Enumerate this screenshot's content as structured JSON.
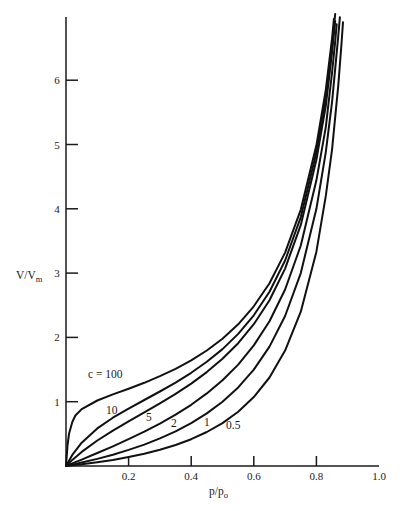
{
  "chart_data": {
    "type": "line",
    "title": "",
    "xlabel": "p/p",
    "xlabel_sub": "o",
    "ylabel": "V/V",
    "ylabel_sub": "m",
    "xlim": [
      0,
      1.0
    ],
    "ylim": [
      0,
      6.98
    ],
    "grid": false,
    "legend": "inline curve labels",
    "x_ticks": [
      {
        "value": 0.2,
        "label": "0.2"
      },
      {
        "value": 0.4,
        "label": "0.4"
      },
      {
        "value": 0.6,
        "label": "0.6"
      },
      {
        "value": 0.8,
        "label": "0.8"
      },
      {
        "value": 1.0,
        "label": "1.0"
      }
    ],
    "y_ticks": [
      {
        "value": 1,
        "label": "1"
      },
      {
        "value": 2,
        "label": "2"
      },
      {
        "value": 3,
        "label": "3"
      },
      {
        "value": 4,
        "label": "4"
      },
      {
        "value": 5,
        "label": "5"
      },
      {
        "value": 6,
        "label": "6"
      }
    ],
    "series": [
      {
        "name": "c = 100",
        "label": "c = 100",
        "label_pos": [
          88,
          378
        ],
        "x": [
          0,
          0.005,
          0.01,
          0.02,
          0.03,
          0.05,
          0.1,
          0.15,
          0.2,
          0.25,
          0.3,
          0.35,
          0.4,
          0.45,
          0.5,
          0.55,
          0.6,
          0.65,
          0.7,
          0.75,
          0.8,
          0.83,
          0.85,
          0.856
        ],
        "y": [
          0,
          0.335,
          0.505,
          0.685,
          0.785,
          0.885,
          1.019,
          1.113,
          1.202,
          1.294,
          1.396,
          1.51,
          1.642,
          1.796,
          1.98,
          2.204,
          2.483,
          2.842,
          3.319,
          3.987,
          4.988,
          5.85,
          6.655,
          6.95
        ]
      },
      {
        "name": "10",
        "label": "10",
        "label_pos": [
          106,
          414
        ],
        "x": [
          0,
          0.02,
          0.05,
          0.1,
          0.15,
          0.2,
          0.25,
          0.3,
          0.35,
          0.4,
          0.45,
          0.5,
          0.55,
          0.6,
          0.65,
          0.7,
          0.75,
          0.8,
          0.83,
          0.85,
          0.86
        ],
        "y": [
          0,
          0.173,
          0.363,
          0.585,
          0.751,
          0.893,
          1.026,
          1.158,
          1.297,
          1.449,
          1.62,
          1.818,
          2.054,
          2.344,
          2.711,
          3.196,
          3.871,
          4.878,
          5.72,
          6.551,
          7.03
        ]
      },
      {
        "name": "5",
        "label": "5",
        "label_pos": [
          146,
          421
        ],
        "x": [
          0,
          0.02,
          0.05,
          0.1,
          0.15,
          0.2,
          0.25,
          0.3,
          0.35,
          0.4,
          0.45,
          0.5,
          0.55,
          0.6,
          0.65,
          0.7,
          0.75,
          0.8,
          0.83,
          0.85,
          0.86
        ],
        "y": [
          0,
          0.0945,
          0.219,
          0.397,
          0.551,
          0.694,
          0.833,
          0.974,
          1.122,
          1.282,
          1.461,
          1.667,
          1.91,
          2.206,
          2.579,
          3.07,
          3.75,
          4.762,
          5.6,
          6.439,
          6.918
        ]
      },
      {
        "name": "2",
        "label": "2",
        "label_pos": [
          171,
          427
        ],
        "x": [
          0,
          0.02,
          0.05,
          0.1,
          0.15,
          0.2,
          0.25,
          0.3,
          0.35,
          0.4,
          0.45,
          0.5,
          0.55,
          0.6,
          0.65,
          0.7,
          0.75,
          0.8,
          0.83,
          0.85,
          0.86,
          0.865
        ],
        "y": [
          0,
          0.04,
          0.1,
          0.202,
          0.307,
          0.417,
          0.533,
          0.659,
          0.798,
          0.952,
          1.129,
          1.333,
          1.577,
          1.875,
          2.251,
          2.745,
          3.429,
          4.444,
          5.27,
          6.126,
          6.605,
          6.871
        ]
      },
      {
        "name": "1",
        "label": "1",
        "label_pos": [
          204,
          426
        ],
        "x": [
          0,
          0.02,
          0.05,
          0.1,
          0.15,
          0.2,
          0.25,
          0.3,
          0.35,
          0.4,
          0.45,
          0.5,
          0.55,
          0.6,
          0.65,
          0.7,
          0.75,
          0.8,
          0.83,
          0.85,
          0.87,
          0.875
        ],
        "y": [
          0,
          0.02,
          0.053,
          0.111,
          0.176,
          0.25,
          0.333,
          0.429,
          0.538,
          0.667,
          0.818,
          1.0,
          1.222,
          1.5,
          1.857,
          2.333,
          3.0,
          4.0,
          4.882,
          5.667,
          6.692,
          6.98
        ]
      },
      {
        "name": "0.5",
        "label": "0.5",
        "label_pos": [
          226,
          429
        ],
        "x": [
          0,
          0.02,
          0.05,
          0.1,
          0.15,
          0.2,
          0.25,
          0.3,
          0.35,
          0.4,
          0.45,
          0.5,
          0.55,
          0.6,
          0.65,
          0.7,
          0.75,
          0.8,
          0.83,
          0.85,
          0.87,
          0.88,
          0.885
        ],
        "y": [
          0,
          0.0103,
          0.027,
          0.0585,
          0.0954,
          0.139,
          0.19,
          0.252,
          0.326,
          0.417,
          0.528,
          0.667,
          0.843,
          1.071,
          1.376,
          1.795,
          2.4,
          3.333,
          4.2,
          4.928,
          5.922,
          6.548,
          6.902
        ]
      }
    ]
  }
}
